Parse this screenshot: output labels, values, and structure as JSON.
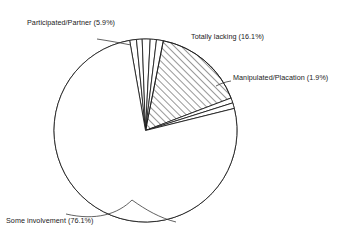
{
  "chart_data": {
    "type": "pie",
    "title": "",
    "subtitle": "",
    "xlabel": "",
    "ylabel": "",
    "legend_position": "none",
    "grid": false,
    "units": "percent",
    "total": 100.0,
    "start_angle_deg": -10,
    "direction": "clockwise",
    "center": {
      "x": 145.5,
      "y": 130.5
    },
    "radius": 91.5,
    "categories": [
      "Participated/Partner",
      "Totally lacking",
      "Manipulated/Placation",
      "Some involvement"
    ],
    "values": [
      5.9,
      16.1,
      1.9,
      76.1
    ],
    "slices": [
      {
        "name": "participated-partner",
        "label": "Participated/Partner (5.9%)",
        "category": "Participated/Partner",
        "value": 5.9,
        "fill": "none",
        "stroke": "#1a1a1a",
        "pattern": "none",
        "subwedges": [
          1.2,
          1.0,
          1.4,
          1.1,
          1.2
        ]
      },
      {
        "name": "totally-lacking",
        "label": "Totally lacking (16.1%)",
        "category": "Totally lacking",
        "value": 16.1,
        "fill": "none",
        "stroke": "#1a1a1a",
        "pattern": "diagonal-hatch"
      },
      {
        "name": "manipulated-placation",
        "label": "Manipulated/Placation (1.9%)",
        "category": "Manipulated/Placation",
        "value": 1.9,
        "fill": "none",
        "stroke": "#1a1a1a",
        "pattern": "none",
        "subwedges": [
          0.9,
          1.0
        ]
      },
      {
        "name": "some-involvement",
        "label": "Some involvement (76.1%)",
        "category": "Some involvement",
        "value": 76.1,
        "fill": "none",
        "stroke": "#1a1a1a",
        "pattern": "none"
      }
    ],
    "colors": {
      "outline": "#1a1a1a",
      "hatch": "#1a1a1a",
      "background": "#ffffff",
      "leader_line": "#3a3a3a"
    }
  },
  "labels": {
    "participated": "Participated/Partner (5.9%)",
    "totally_lacking": "Totally lacking (16.1%)",
    "manipulated": "Manipulated/Placation (1.9%)",
    "some_involvement": "Some involvement (76.1%)"
  }
}
